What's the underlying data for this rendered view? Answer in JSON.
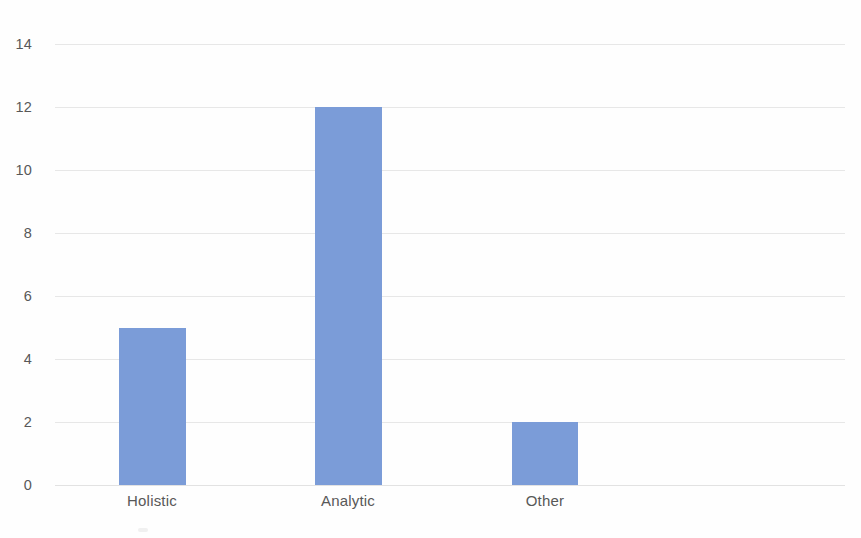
{
  "chart_data": {
    "type": "bar",
    "title": "",
    "subtitle": "",
    "xlabel": "",
    "ylabel": "",
    "categories": [
      "Holistic",
      "Analytic",
      "Other"
    ],
    "values": [
      5,
      12,
      2
    ],
    "series": [
      {
        "name": "Count",
        "values": [
          5,
          12,
          2
        ]
      }
    ],
    "ylim": [
      0,
      14
    ],
    "xlim": [
      0,
      4
    ],
    "y_ticks": [
      0,
      2,
      4,
      6,
      8,
      10,
      12,
      14
    ],
    "y_tick_labels": [
      "0",
      "2",
      "4",
      "6",
      "8",
      "10",
      "12",
      "14"
    ],
    "grid": "horizontal",
    "legend": "none",
    "annotations": [],
    "bar_color": "#7b9cd8",
    "gridline_color": "#e6e6e6",
    "axis_text_color": "#585858",
    "background_color": "#fefefe"
  },
  "axis": {
    "y_labels": [
      "14",
      "12",
      "10",
      "8",
      "6",
      "4",
      "2",
      "0"
    ],
    "x_labels": [
      "Holistic",
      "Analytic",
      "Other"
    ]
  },
  "bars": [
    {
      "label": "Holistic",
      "value": 5
    },
    {
      "label": "Analytic",
      "value": 12
    },
    {
      "label": "Other",
      "value": 2
    }
  ]
}
